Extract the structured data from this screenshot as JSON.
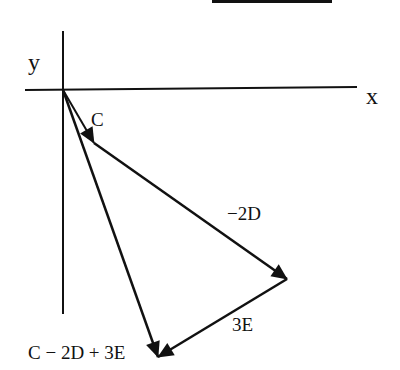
{
  "diagram": {
    "axes": {
      "x_label": "x",
      "y_label": "y",
      "origin": [
        63,
        90
      ]
    },
    "vectors": [
      {
        "id": "C",
        "label": "C",
        "from": [
          63,
          90
        ],
        "to": [
          94,
          143
        ]
      },
      {
        "id": "minus-2D",
        "label": "−2D",
        "from": [
          94,
          143
        ],
        "to": [
          287,
          279
        ]
      },
      {
        "id": "3E",
        "label": "3E",
        "from": [
          287,
          279
        ],
        "to": [
          158,
          357
        ]
      },
      {
        "id": "resultant",
        "label": "C − 2D + 3E",
        "from": [
          63,
          90
        ],
        "to": [
          158,
          357
        ]
      }
    ],
    "stroke_color": "#111111",
    "background": "#ffffff"
  }
}
